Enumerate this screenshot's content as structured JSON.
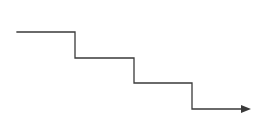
{
  "diagram": {
    "type": "descending-staircase-arrow",
    "stroke_color": "#3a3a3a",
    "background": "#ffffff",
    "points": "17,32 75,32 75,58 134,58 134,83 192,83 192,109 244,109",
    "arrowhead": "251,109 241,105 241,113"
  }
}
